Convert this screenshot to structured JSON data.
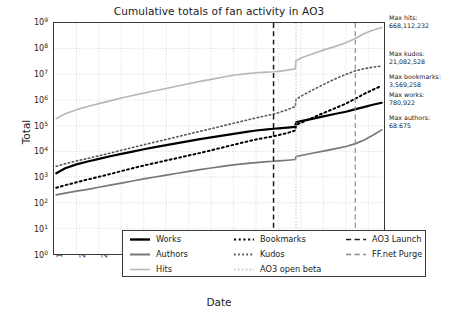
{
  "chart_data": {
    "type": "line",
    "title": "Cumulative totals of fan activity in AO3",
    "xlabel": "Date",
    "ylabel": "Total",
    "yscale": "log",
    "ylim": [
      1,
      1000000000
    ],
    "xlim": [
      1999,
      2013.7
    ],
    "grid": true,
    "legend_position": "lower center, inside axes, 3 columns",
    "ytick_labels": [
      "10^0",
      "10^1",
      "10^2",
      "10^3",
      "10^4",
      "10^5",
      "10^6",
      "10^7",
      "10^8",
      "10^9"
    ],
    "ytick_values": [
      1,
      10,
      100,
      1000,
      10000,
      100000,
      1000000,
      10000000,
      100000000,
      1000000000
    ],
    "xtick_labels": [
      "1999",
      "2000",
      "2001",
      "2002",
      "2003",
      "2004",
      "2005",
      "2006",
      "2007",
      "2008",
      "2009",
      "2010",
      "2011",
      "2012",
      "2013"
    ],
    "xtick_values": [
      1999,
      2000,
      2001,
      2002,
      2003,
      2004,
      2005,
      2006,
      2007,
      2008,
      2009,
      2010,
      2011,
      2012,
      2013
    ],
    "series": [
      {
        "name": "Works",
        "style": "solid",
        "color": "#000000",
        "width": 2.2,
        "x": [
          1999.1,
          1999.5,
          2000.0,
          2000.5,
          2001.0,
          2001.5,
          2002.0,
          2002.5,
          2003.0,
          2003.5,
          2004.0,
          2004.5,
          2005.0,
          2005.5,
          2006.0,
          2006.5,
          2007.0,
          2007.5,
          2008.0,
          2008.5,
          2008.8,
          2009.0,
          2009.4,
          2009.75,
          2009.78,
          2010.0,
          2010.5,
          2011.0,
          2011.5,
          2012.0,
          2012.4,
          2012.8,
          2013.2,
          2013.6
        ],
        "y": [
          1400,
          2200,
          3100,
          4000,
          5100,
          6400,
          8000,
          9800,
          12000,
          14500,
          17500,
          21000,
          25000,
          30000,
          35000,
          41000,
          48000,
          56000,
          65000,
          72000,
          76000,
          79000,
          84000,
          90000,
          135000,
          150000,
          185000,
          230000,
          285000,
          350000,
          430000,
          530000,
          650000,
          780922
        ]
      },
      {
        "name": "Authors",
        "style": "solid",
        "color": "#777777",
        "width": 1.7,
        "x": [
          1999.1,
          1999.5,
          2000.0,
          2000.5,
          2001.0,
          2001.5,
          2002.0,
          2002.5,
          2003.0,
          2003.5,
          2004.0,
          2004.5,
          2005.0,
          2005.5,
          2006.0,
          2006.5,
          2007.0,
          2007.5,
          2008.0,
          2008.5,
          2008.8,
          2009.0,
          2009.4,
          2009.75,
          2009.78,
          2010.0,
          2010.5,
          2011.0,
          2011.5,
          2012.0,
          2012.4,
          2012.8,
          2013.2,
          2013.6
        ],
        "y": [
          200,
          235,
          280,
          330,
          400,
          480,
          580,
          700,
          840,
          1000,
          1180,
          1400,
          1650,
          1950,
          2250,
          2600,
          2950,
          3300,
          3650,
          3950,
          4100,
          4250,
          4500,
          4800,
          6300,
          6900,
          8400,
          10200,
          12500,
          15500,
          19500,
          27000,
          42000,
          68675
        ]
      },
      {
        "name": "Hits",
        "style": "solid",
        "color": "#b8b8b8",
        "width": 1.7,
        "x": [
          1999.1,
          1999.5,
          2000.0,
          2000.5,
          2001.0,
          2001.5,
          2002.0,
          2002.5,
          2003.0,
          2003.5,
          2004.0,
          2004.5,
          2005.0,
          2005.5,
          2006.0,
          2006.5,
          2007.0,
          2007.5,
          2008.0,
          2008.5,
          2008.8,
          2009.0,
          2009.4,
          2009.75,
          2009.78,
          2010.0,
          2010.5,
          2011.0,
          2011.5,
          2012.0,
          2012.4,
          2012.8,
          2013.2,
          2013.6
        ],
        "y": [
          190000,
          290000,
          420000,
          560000,
          720000,
          920000,
          1200000,
          1500000,
          1850000,
          2300000,
          2800000,
          3500000,
          4300000,
          5300000,
          6400000,
          7700000,
          9200000,
          10500000,
          11500000,
          12200000,
          12600000,
          13000000,
          14500000,
          16500000,
          34000000,
          43000000,
          62000000,
          88000000,
          120000000,
          170000000,
          245000000,
          380000000,
          520000000,
          668112232
        ]
      },
      {
        "name": "Bookmarks",
        "style": "dotted-coarse",
        "color": "#000000",
        "width": 2.0,
        "x": [
          1999.1,
          1999.5,
          2000.0,
          2000.5,
          2001.0,
          2001.5,
          2002.0,
          2002.5,
          2003.0,
          2003.5,
          2004.0,
          2004.5,
          2005.0,
          2005.5,
          2006.0,
          2006.5,
          2007.0,
          2007.5,
          2008.0,
          2008.5,
          2008.8,
          2009.0,
          2009.4,
          2009.75,
          2009.78,
          2010.0,
          2010.5,
          2011.0,
          2011.5,
          2012.0,
          2012.4,
          2012.8,
          2013.2,
          2013.6
        ],
        "y": [
          380,
          480,
          620,
          800,
          1020,
          1300,
          1700,
          2200,
          2800,
          3500,
          4400,
          5500,
          6900,
          8600,
          11000,
          14000,
          18000,
          23000,
          29000,
          35000,
          39000,
          43000,
          52000,
          65000,
          105000,
          130000,
          200000,
          310000,
          470000,
          720000,
          1100000,
          1700000,
          2500000,
          3569258
        ]
      },
      {
        "name": "Kudos",
        "style": "dotted-fine",
        "color": "#555555",
        "width": 1.6,
        "x": [
          1999.1,
          1999.5,
          2000.0,
          2000.5,
          2001.0,
          2001.5,
          2002.0,
          2002.5,
          2003.0,
          2003.5,
          2004.0,
          2004.5,
          2005.0,
          2005.5,
          2006.0,
          2006.5,
          2007.0,
          2007.5,
          2008.0,
          2008.5,
          2008.8,
          2009.0,
          2009.4,
          2009.75,
          2009.78,
          2010.0,
          2010.5,
          2011.0,
          2011.5,
          2012.0,
          2012.4,
          2012.8,
          2013.2,
          2013.6
        ],
        "y": [
          2600,
          3300,
          4200,
          5300,
          6700,
          8500,
          11000,
          14000,
          18000,
          23000,
          29000,
          37000,
          47000,
          60000,
          76000,
          97000,
          124000,
          158000,
          200000,
          250000,
          285000,
          320000,
          420000,
          560000,
          1050000,
          1400000,
          2400000,
          4000000,
          6500000,
          10000000,
          13500000,
          16500000,
          19000000,
          21082528
        ]
      }
    ],
    "event_lines": [
      {
        "name": "AO3 Launch",
        "x": 2008.78,
        "style": "dashed",
        "color": "#1a1a1a",
        "width": 1.5
      },
      {
        "name": "AO3 open beta",
        "x": 2009.78,
        "style": "dotted-fine",
        "color": "#c0c0c0",
        "width": 1.2
      },
      {
        "name": "FF.net Purge",
        "x": 2012.42,
        "style": "dashed",
        "color": "#8c8c8c",
        "width": 1.2
      }
    ],
    "annotations": [
      {
        "label": "Max hits:",
        "value": "668,112,232",
        "top": 14
      },
      {
        "label": "Max kudos:",
        "value": "21,082,528",
        "top": 50
      },
      {
        "label": "Max bookmarks:",
        "value": "3,569,258",
        "top": 73
      },
      {
        "label": "Max works:",
        "value": "780,922",
        "top": 91
      },
      {
        "label": "Max authors:",
        "value": "68.675",
        "top": 114
      }
    ]
  },
  "legend": {
    "entries": [
      {
        "label": "Works",
        "swatch": "solid-thick-black"
      },
      {
        "label": "Bookmarks",
        "swatch": "dotted-coarse-black"
      },
      {
        "label": "AO3 Launch",
        "swatch": "dashed-black"
      },
      {
        "label": "Authors",
        "swatch": "solid-gray"
      },
      {
        "label": "Kudos",
        "swatch": "dotted-fine-gray"
      },
      {
        "label": "FF.net Purge",
        "swatch": "dashed-gray"
      },
      {
        "label": "Hits",
        "swatch": "solid-lightgray"
      },
      {
        "label": "AO3 open beta",
        "swatch": "dotted-fine-lightgray"
      }
    ]
  }
}
